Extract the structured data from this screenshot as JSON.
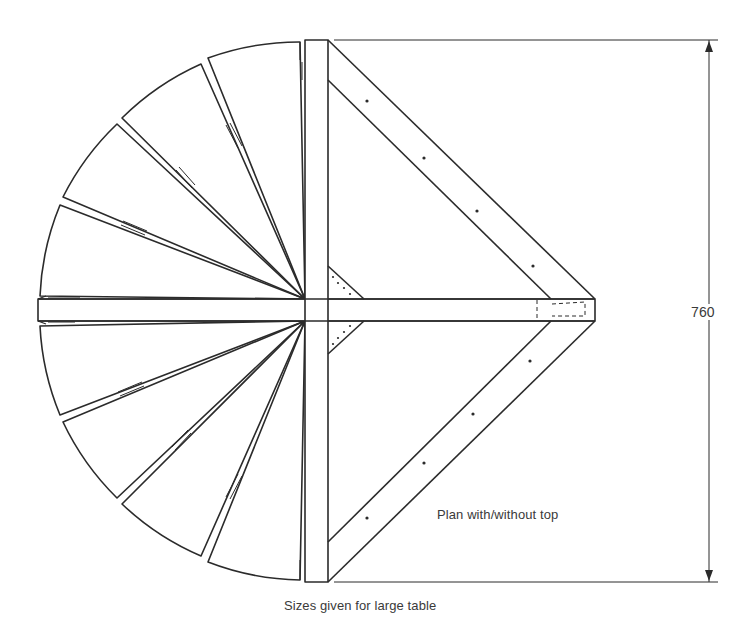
{
  "drawing": {
    "title": "Table plan drawing",
    "captions": {
      "plan": "Plan with/without top",
      "sizes_note": "Sizes given for large table"
    },
    "dimension": {
      "value": "760",
      "orientation": "vertical"
    },
    "components": {
      "fan_leaves_upper": 5,
      "fan_leaves_lower": 5,
      "diagonal_braces": 2,
      "corner_gussets": 2
    },
    "colors": {
      "line": "#2b2b2b",
      "background": "#ffffff",
      "text": "#3a3a3a"
    }
  }
}
